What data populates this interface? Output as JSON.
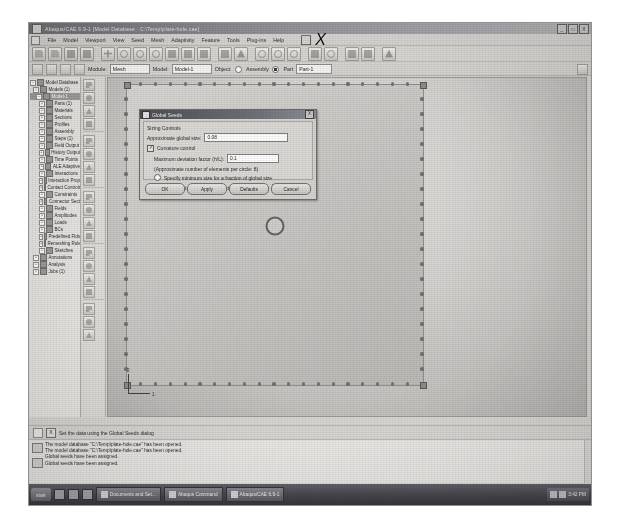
{
  "window": {
    "title": "Abaqus/CAE 6.9-1  [Model Database : C:\\Temp\\plate-hole.cae]",
    "buttons": [
      "_",
      "□",
      "X"
    ],
    "app_icon": "abaqus-icon"
  },
  "menubar": {
    "system_icon": "system-menu-icon",
    "items": [
      "File",
      "Model",
      "Viewport",
      "View",
      "Seed",
      "Mesh",
      "Adaptivity",
      "Feature",
      "Tools",
      "Plug-ins",
      "Help"
    ],
    "window_buttons": [
      "_",
      "□",
      "X"
    ]
  },
  "toolbar": {
    "buttons": [
      {
        "name": "new-model-database-icon",
        "label": "New"
      },
      {
        "name": "open-database-icon",
        "label": "Open"
      },
      {
        "name": "save-database-icon",
        "label": "Save"
      },
      {
        "name": "print-icon",
        "label": "Print"
      },
      {
        "name": "zoom-in-icon",
        "label": "Zoom In"
      },
      {
        "name": "undo-icon",
        "label": "Undo"
      },
      {
        "name": "query-icon",
        "label": "Query"
      },
      {
        "name": "magnify-icon",
        "label": "Magnify View"
      },
      {
        "name": "fit-view-icon",
        "label": "Auto-Fit View"
      },
      {
        "name": "pan-icon",
        "label": "Pan View"
      },
      {
        "name": "box-zoom-icon",
        "label": "Box Zoom"
      },
      {
        "name": "render-shaded-icon",
        "label": "Shaded"
      },
      {
        "name": "render-wireframe-icon",
        "label": "Wireframe"
      },
      {
        "name": "rotate-view-icon",
        "label": "Rotate"
      },
      {
        "name": "view-front-icon",
        "label": "Front View"
      },
      {
        "name": "view-iso-icon",
        "label": "Iso View"
      },
      {
        "name": "color-code-icon",
        "label": "Color Code"
      },
      {
        "name": "clock-icon",
        "label": "Step Time"
      },
      {
        "name": "plot-contours-icon",
        "label": "Contours"
      },
      {
        "name": "viewport-icon",
        "label": "Viewport"
      },
      {
        "name": "help-on-context-icon",
        "label": "Help"
      }
    ]
  },
  "contextbar": {
    "nav_icons": [
      "previous-icon",
      "next-icon",
      "pick-icon",
      "bulb-icon"
    ],
    "module_label": "Module:",
    "module_value": "Mesh",
    "model_label": "Model:",
    "model_value": "Model-1",
    "object_label": "Object:",
    "object_assembly": "Assembly",
    "object_part": "Part",
    "object_selected": "Part",
    "part_value": "Part-1"
  },
  "tree": {
    "items": [
      {
        "label": "Model Database",
        "depth": 0,
        "expander": "-"
      },
      {
        "label": "Models (1)",
        "depth": 1,
        "expander": "-"
      },
      {
        "label": "Model-1",
        "depth": 2,
        "expander": "-",
        "selected": true
      },
      {
        "label": "Parts (1)",
        "depth": 3,
        "expander": "+"
      },
      {
        "label": "Materials",
        "depth": 3,
        "expander": "+"
      },
      {
        "label": "Sections",
        "depth": 3,
        "expander": "+"
      },
      {
        "label": "Profiles",
        "depth": 3,
        "expander": "+"
      },
      {
        "label": "Assembly",
        "depth": 3,
        "expander": "+"
      },
      {
        "label": "Steps (1)",
        "depth": 3,
        "expander": "+"
      },
      {
        "label": "Field Output",
        "depth": 3,
        "expander": "+"
      },
      {
        "label": "History Output",
        "depth": 3,
        "expander": "+"
      },
      {
        "label": "Time Points",
        "depth": 3,
        "expander": "+"
      },
      {
        "label": "ALE Adaptive",
        "depth": 3,
        "expander": "+"
      },
      {
        "label": "Interactions",
        "depth": 3,
        "expander": "+"
      },
      {
        "label": "Interaction Prop",
        "depth": 3,
        "expander": "+"
      },
      {
        "label": "Contact Controls",
        "depth": 3,
        "expander": "+"
      },
      {
        "label": "Constraints",
        "depth": 3,
        "expander": "+"
      },
      {
        "label": "Connector Sect",
        "depth": 3,
        "expander": "+"
      },
      {
        "label": "Fields",
        "depth": 3,
        "expander": "+"
      },
      {
        "label": "Amplitudes",
        "depth": 3,
        "expander": "+"
      },
      {
        "label": "Loads",
        "depth": 3,
        "expander": "+"
      },
      {
        "label": "BCs",
        "depth": 3,
        "expander": "+"
      },
      {
        "label": "Predefined Flds",
        "depth": 3,
        "expander": "+"
      },
      {
        "label": "Remeshing Rules",
        "depth": 3,
        "expander": "+"
      },
      {
        "label": "Sketches",
        "depth": 3,
        "expander": "+"
      },
      {
        "label": "Annotations",
        "depth": 1,
        "expander": "+"
      },
      {
        "label": "Analysis",
        "depth": 1,
        "expander": "+"
      },
      {
        "label": "Jobs (1)",
        "depth": 1,
        "expander": "+"
      }
    ]
  },
  "toolbox": {
    "tools": [
      {
        "name": "seed-part-icon",
        "label": "Seed Part"
      },
      {
        "name": "seed-edges-icon",
        "label": "Seed Edges"
      },
      {
        "name": "delete-seeds-icon",
        "label": "Delete Part Seeds"
      },
      {
        "name": "delete-edge-seeds-icon",
        "label": "Delete Edge Seeds"
      },
      {
        "name": "assign-mesh-controls-icon",
        "label": "Assign Mesh Controls"
      },
      {
        "name": "assign-element-type-icon",
        "label": "Assign Element Type"
      },
      {
        "name": "mesh-part-icon",
        "label": "Mesh Part"
      },
      {
        "name": "mesh-region-icon",
        "label": "Mesh Region"
      },
      {
        "name": "delete-mesh-icon",
        "label": "Delete Part Mesh"
      },
      {
        "name": "verify-mesh-icon",
        "label": "Verify Mesh"
      },
      {
        "name": "query-mesh-icon",
        "label": "Query Mesh"
      },
      {
        "name": "edit-mesh-icon",
        "label": "Edit Mesh"
      },
      {
        "name": "remesh-rule-icon",
        "label": "Remeshing Rule"
      },
      {
        "name": "create-bottom-up-icon",
        "label": "Create Bottom-Up Mesh"
      },
      {
        "name": "partition-cell-icon",
        "label": "Partition Cell"
      },
      {
        "name": "partition-face-icon",
        "label": "Partition Face"
      },
      {
        "name": "datum-plane-icon",
        "label": "Datum Plane"
      },
      {
        "name": "datum-point-icon",
        "label": "Datum Point"
      },
      {
        "name": "virtual-topology-icon",
        "label": "Virtual Topology"
      }
    ]
  },
  "viewport": {
    "part_name": "Part-1",
    "triad_x_label": "1",
    "triad_y_label": "2",
    "seed_count_per_side": 20,
    "hole_label": "circular hole"
  },
  "dialog": {
    "title": "Global Seeds",
    "icon": "global-seeds-icon",
    "close_label": "X",
    "group_label": "Sizing Controls",
    "global_size_label": "Approximate global size:",
    "global_size_value": "0.08",
    "curvature_control_label": "Curvature control",
    "curvature_control_checked": true,
    "deviation_label": "Maximum deviation factor (h/L):",
    "deviation_value": "0.1",
    "elements_per_circle_label": "(Approximate number of elements per circle: 8)",
    "min_size_radio_label": "Specify minimum size for a fraction of global size",
    "min_size_radio_checked": false,
    "min_size_sub_label": "Minimum size factor (as a fraction of global size):",
    "min_size_sub_value": "0.1",
    "buttons": [
      "OK",
      "Apply",
      "Defaults",
      "Cancel"
    ]
  },
  "prompt": {
    "cancel_label": "X",
    "text": "Set the data using the Global Seeds dialog"
  },
  "messages": {
    "icons": [
      "message-area-icon",
      "command-line-icon"
    ],
    "lines": [
      "The model database \"C:\\Temp\\plate-hole.cae\" has been opened.",
      "The model database \"C:\\Temp\\plate-hole.cae\" has been opened.",
      "Global seeds have been assigned.",
      "Global seeds have been assigned."
    ]
  },
  "taskbar": {
    "start_label": "start",
    "quick_launch": [
      "show-desktop-icon",
      "browser-icon",
      "media-icon"
    ],
    "items": [
      {
        "icon": "folder-icon",
        "label": "Documents and Set..."
      },
      {
        "icon": "abaqus-icon",
        "label": "Abaqus Command"
      },
      {
        "icon": "abaqus-cae-icon",
        "label": "Abaqus/CAE 6.9-1"
      }
    ],
    "tray_time": "3:42 PM",
    "tray_icons": [
      "volume-icon",
      "network-icon"
    ]
  },
  "colors": {
    "titlebar": "#6a6a70",
    "dialog_title": "#45454c",
    "panel": "#d6d4d0",
    "viewport_bg": "#c6c4c1",
    "part_fill": "#cfcdca",
    "seed_marker": "#6f6d6a"
  }
}
